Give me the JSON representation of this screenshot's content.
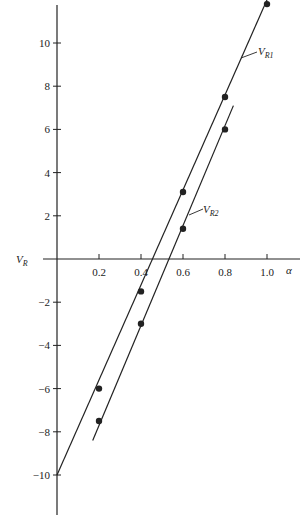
{
  "chart_data": {
    "type": "line",
    "title": "",
    "xlabel": "α",
    "ylabel": "V_R",
    "xlim": [
      0,
      1.1
    ],
    "ylim": [
      -12,
      12
    ],
    "grid": false,
    "x_ticks": [
      "0.2",
      "0.4",
      "0.6",
      "0.8",
      "1.0"
    ],
    "x_tick_values": [
      0.2,
      0.4,
      0.6,
      0.8,
      1.0
    ],
    "y_ticks": [
      "10",
      "8",
      "6",
      "4",
      "2",
      "-2",
      "-4",
      "-6",
      "-8",
      "-10"
    ],
    "y_tick_values": [
      10,
      8,
      6,
      4,
      2,
      -2,
      -4,
      -6,
      -8,
      -10
    ],
    "series": [
      {
        "name": "V_R1",
        "label_main": "V",
        "label_sub": "R1",
        "points": [
          {
            "x": 0.2,
            "y": -6.0
          },
          {
            "x": 0.4,
            "y": -1.5
          },
          {
            "x": 0.6,
            "y": 3.1
          },
          {
            "x": 0.8,
            "y": 7.5
          },
          {
            "x": 1.0,
            "y": 11.8
          }
        ],
        "fit_line": {
          "x0": 0.0,
          "y0": -10.0,
          "x1": 1.0,
          "y1": 12.0
        }
      },
      {
        "name": "V_R2",
        "label_main": "V",
        "label_sub": "R2",
        "points": [
          {
            "x": 0.2,
            "y": -7.5
          },
          {
            "x": 0.4,
            "y": -3.0
          },
          {
            "x": 0.6,
            "y": 1.4
          },
          {
            "x": 0.8,
            "y": 6.0
          }
        ],
        "fit_line": {
          "x0": 0.17,
          "y0": -8.4,
          "x1": 0.84,
          "y1": 7.1
        }
      }
    ],
    "axis_labels": {
      "x": "α",
      "y_main": "V",
      "y_sub": "R"
    }
  },
  "colors": {
    "ink": "#222222",
    "background": "#ffffff"
  }
}
